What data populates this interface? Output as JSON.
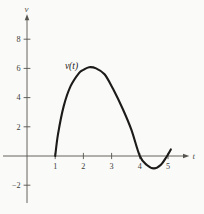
{
  "figure": {
    "background": "#fafaf8",
    "axis_color": "#56544e",
    "tick_text_color": "#403e39",
    "curve_color": "#1c1b19"
  },
  "chart_data": {
    "type": "line",
    "title": "",
    "xlabel": "t",
    "ylabel": "v",
    "curve_label": "v(t)",
    "xlim": [
      0,
      5.6
    ],
    "ylim": [
      -3.2,
      9.6
    ],
    "grid": false,
    "legend": "none",
    "x_ticks": {
      "values": [
        1,
        2,
        3,
        4,
        5
      ],
      "labels": [
        "1",
        "2",
        "3",
        "4",
        "5"
      ]
    },
    "y_ticks": {
      "values": [
        8,
        6,
        4,
        2,
        -2
      ],
      "labels": [
        "8",
        "6",
        "4",
        "2",
        "−2"
      ]
    },
    "series": [
      {
        "name": "v(t)",
        "x": [
          1.0,
          1.1,
          1.3,
          1.55,
          1.85,
          2.0,
          2.2,
          2.45,
          2.75,
          3.05,
          3.4,
          3.7,
          4.0,
          4.25,
          4.5,
          4.75,
          4.95,
          5.1
        ],
        "y": [
          0,
          1.5,
          3.4,
          4.8,
          5.7,
          5.9,
          6.08,
          6.0,
          5.6,
          4.6,
          3.2,
          1.8,
          0,
          -0.62,
          -0.85,
          -0.6,
          -0.05,
          0.45
        ]
      }
    ]
  }
}
